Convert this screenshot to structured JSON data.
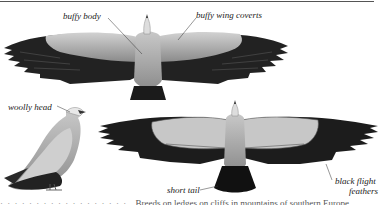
{
  "labels": {
    "buffy_body": "buffy body",
    "buffy_wing_coverts": "buffy wing coverts",
    "woolly_head": "woolly head",
    "short_tail": "short tail",
    "black_flight_feathers_1": "black flight",
    "black_flight_feathers_2": "feathers"
  },
  "caption": {
    "lead": "· · · · · · · · · · · · · · · · · ·",
    "text": "Breeds on ledges on cliffs in mountains of southern Europe"
  },
  "colors": {
    "ink": "#222222",
    "flight_feathers": "#1e1e1e",
    "coverts": "#b8b8b8",
    "body": "#a9a9a9"
  }
}
